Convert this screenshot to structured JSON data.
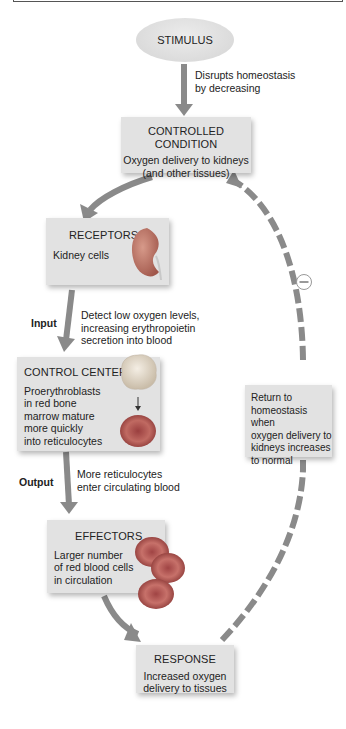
{
  "diagram": {
    "type": "negative-feedback-loop",
    "stimulus": {
      "label": "STIMULUS"
    },
    "stimulus_arrow_note": [
      "Disrupts homeostasis",
      "by decreasing"
    ],
    "controlled_condition": {
      "title": "CONTROLLED CONDITION",
      "body": [
        "Oxygen delivery to kidneys",
        "(and other tissues)"
      ]
    },
    "receptors": {
      "title": "RECEPTORS",
      "body": "Kidney cells",
      "image": "kidney-icon"
    },
    "input": {
      "label": "Input",
      "note": [
        "Detect low oxygen levels,",
        "increasing erythropoietin",
        "secretion into blood"
      ]
    },
    "control_center": {
      "title": "CONTROL CENTER",
      "body": [
        "Proerythroblasts",
        "in red bone",
        "marrow mature",
        "more quickly",
        "into reticulocytes"
      ],
      "image": "proerythroblast-to-reticulocyte-icon"
    },
    "output": {
      "label": "Output",
      "note": [
        "More reticulocytes",
        "enter circulating blood"
      ]
    },
    "effectors": {
      "title": "EFFECTORS",
      "body": [
        "Larger number",
        "of red blood cells",
        "in circulation"
      ],
      "image": "red-blood-cells-icon"
    },
    "response": {
      "title": "RESPONSE",
      "body": [
        "Increased oxygen",
        "delivery to tissues"
      ]
    },
    "return_note": {
      "body": [
        "Return to",
        "homeostasis when",
        "oxygen delivery to",
        "kidneys increases",
        "to normal"
      ]
    },
    "feedback_sign": "−",
    "colors": {
      "arrow": "#8a8a8a",
      "box": "#e2e2e2",
      "rbc": "#b5575a"
    }
  }
}
